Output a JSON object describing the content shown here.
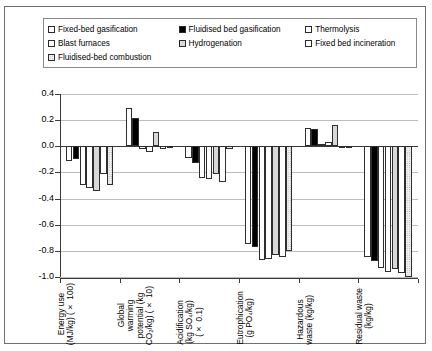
{
  "legend": {
    "rows": [
      [
        {
          "label": "Fixed-bed gasification",
          "swatch": "white"
        },
        {
          "label": "Fluidised bed gasification",
          "swatch": "black"
        },
        {
          "label": "Thermolysis",
          "swatch": "white"
        }
      ],
      [
        {
          "label": "Blast furnaces",
          "swatch": "dots"
        },
        {
          "label": "Hydrogenation",
          "swatch": "grey"
        },
        {
          "label": "Fixed bed incineration",
          "swatch": "white"
        }
      ],
      [
        {
          "label": "Fluidised-bed combustion",
          "swatch": "hdots"
        }
      ]
    ]
  },
  "axis": {
    "y_ticks": [
      "0.4",
      "0.2",
      "0.0",
      "-0.2",
      "-0.4",
      "-0.6",
      "-0.8",
      "-1.0"
    ],
    "y_min": -1.0,
    "y_max": 0.4
  },
  "chart_data": {
    "type": "bar",
    "title": "",
    "xlabel": "",
    "ylabel": "",
    "ylim": [
      -1.0,
      0.4
    ],
    "grid": true,
    "legend_position": "top",
    "categories": [
      "Energy use\n(MJ/kg) (× 100)",
      "Global\nwarming\npotential (kg\nCO₂/kg) (× 10)",
      "Acidification\n(kg  SO₄/kg)\n(× 0.1)",
      "Eutrophication\n(g PO₄/kg)",
      "Hazardous\nwaste (kg/kg)",
      "Residual waste\n(kg/kg)"
    ],
    "series": [
      {
        "name": "Fixed-bed gasification",
        "pattern": "white",
        "values": [
          -0.11,
          0.29,
          -0.09,
          -0.75,
          0.14,
          -0.85
        ]
      },
      {
        "name": "Fluidised bed gasification",
        "pattern": "black",
        "values": [
          -0.1,
          0.22,
          -0.13,
          -0.77,
          0.13,
          -0.88
        ]
      },
      {
        "name": "Thermolysis",
        "pattern": "white",
        "values": [
          -0.3,
          -0.02,
          -0.24,
          -0.87,
          0.02,
          -0.93
        ]
      },
      {
        "name": "Blast furnaces",
        "pattern": "dots",
        "values": [
          -0.32,
          -0.04,
          -0.25,
          -0.86,
          0.03,
          -0.96
        ]
      },
      {
        "name": "Hydrogenation",
        "pattern": "grey",
        "values": [
          -0.34,
          0.11,
          -0.21,
          -0.83,
          0.16,
          -0.94
        ]
      },
      {
        "name": "Fixed bed incineration",
        "pattern": "white",
        "values": [
          -0.21,
          -0.02,
          -0.27,
          -0.85,
          0.0,
          -0.97
        ]
      },
      {
        "name": "Fluidised-bed combustion",
        "pattern": "hdots",
        "values": [
          -0.3,
          0.0,
          -0.02,
          -0.8,
          0.0,
          -1.0
        ]
      }
    ]
  }
}
